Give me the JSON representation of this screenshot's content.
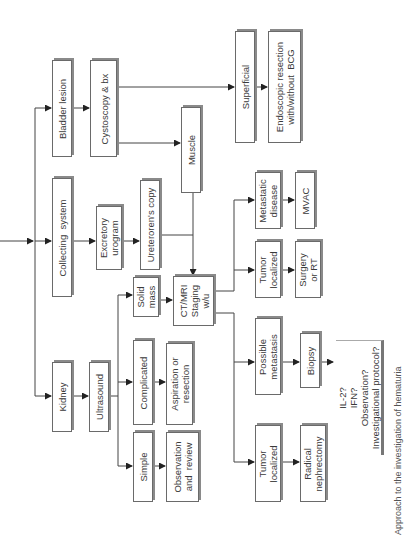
{
  "diagram": {
    "orientation": "rotated-90-ccw",
    "nodes": {
      "bladder_lesion": "Bladder lesion",
      "cystoscopy_bx": "Cystoscopy & bx",
      "superficial": "Superficial",
      "endoscopic_resection": "Endoscopic resection\nwith/without  BCG",
      "muscle": "Muscle",
      "collecting_system": "Collecting  system",
      "excretory_urogram": "Excretory\nurogram",
      "ureterorenoscopy": "Ureteroren's copy",
      "kidney": "Kidney",
      "ultrasound": "Ultrasound",
      "solid_mass": "Solid\nmass",
      "ct_mri_staging": "CT/MRI\nStaging\nw/u",
      "complicated": "Complicated",
      "aspiration_resection": "Aspiration or\nresection",
      "simple": "Simple",
      "observation_review": "Observation\nand  review",
      "metastatic_disease": "Metastatic\ndisease",
      "mvac": "MVAC",
      "tumor_localized_1": "Tumor\nlocalized",
      "surgery_rt": "Surgery\nor RT",
      "possible_metastasis": "Possible\nmetastasis",
      "biopsy": "Biopsy",
      "systemic_options": "IL-2?\nIFN?\nObservation?\nInvestigational protocol?",
      "tumor_localized_2": "Tumor\nlocalized",
      "radical_nephrectomy": "Radical\nnephrectomy"
    },
    "caption": "Approach to the investigation of hematuria"
  }
}
